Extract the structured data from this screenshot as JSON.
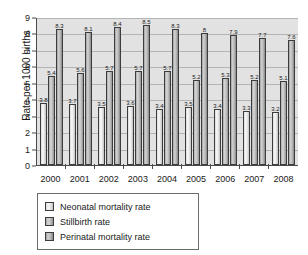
{
  "chart_data": {
    "type": "bar",
    "title": "",
    "xlabel": "",
    "ylabel": "Rate per 1000 births",
    "ylim": [
      0,
      9
    ],
    "yticks": [
      0,
      1,
      2,
      3,
      4,
      5,
      6,
      7,
      8,
      9
    ],
    "grid": true,
    "legend_position": "bottom-left",
    "categories": [
      "2000",
      "2001",
      "2002",
      "2003",
      "2004",
      "2005",
      "2006",
      "2007",
      "2008"
    ],
    "series": [
      {
        "name": "Neonatal mortality rate",
        "color": "#efefef",
        "values": [
          3.8,
          3.7,
          3.5,
          3.6,
          3.4,
          3.5,
          3.4,
          3.3,
          3.2
        ],
        "labels": [
          "3.8",
          "3.7",
          "3.5",
          "3.6",
          "3.4",
          "3.5",
          "3.4",
          "3.3",
          "3.2"
        ]
      },
      {
        "name": "Stillbirth rate",
        "color": "#c9c9c9",
        "values": [
          5.4,
          5.6,
          5.7,
          5.7,
          5.7,
          5.2,
          5.3,
          5.2,
          5.1
        ],
        "labels": [
          "5.4",
          "5.6",
          "5.7",
          "5.7",
          "5.7",
          "5.2",
          "5.3",
          "5.2",
          "5.1"
        ]
      },
      {
        "name": "Perinatal mortality rate",
        "color": "#c3c3c3",
        "values": [
          8.3,
          8.1,
          8.4,
          8.5,
          8.3,
          8.0,
          7.9,
          7.7,
          7.6
        ],
        "labels": [
          "8.3",
          "8.1",
          "8.4",
          "8.5",
          "8.3",
          "8",
          "7.9",
          "7.7",
          "7.6"
        ]
      }
    ]
  },
  "legend": {
    "items": [
      {
        "label": "Neonatal mortality rate"
      },
      {
        "label": "Stillbirth rate"
      },
      {
        "label": "Perinatal mortality rate"
      }
    ]
  }
}
